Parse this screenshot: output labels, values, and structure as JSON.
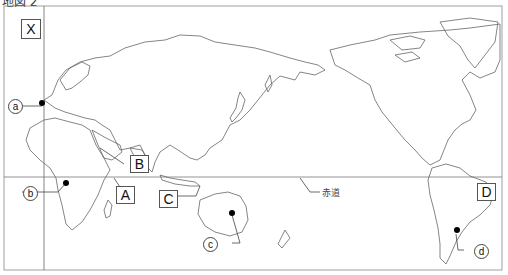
{
  "title": "地図 2",
  "equator_label": "赤道",
  "region_labels": [
    {
      "id": "X",
      "label": "X"
    },
    {
      "id": "A",
      "label": "A"
    },
    {
      "id": "B",
      "label": "B"
    },
    {
      "id": "C",
      "label": "C"
    },
    {
      "id": "D",
      "label": "D"
    }
  ],
  "point_labels": [
    {
      "id": "a",
      "label": "a"
    },
    {
      "id": "b",
      "label": "b"
    },
    {
      "id": "c",
      "label": "c"
    },
    {
      "id": "d",
      "label": "d"
    }
  ],
  "colors": {
    "line": "#555555",
    "point": "#000000",
    "background": "#ffffff"
  }
}
